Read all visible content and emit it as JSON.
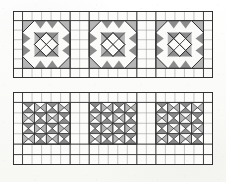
{
  "figure": {
    "background_color": "#fdfdfc",
    "grid_line_color": "#8d8d8d",
    "grid_line_color_major": "#3a3a3a",
    "outline_color": "#2b2b2b",
    "shade_dark": "#8f8f8f",
    "shade_light": "#bcbcbc",
    "shade_white": "#fbfbfa"
  },
  "panels": [
    {
      "id": "panel-top",
      "name": "top-panel",
      "columns": 21,
      "rows": 7,
      "cell_size": 9.52,
      "blocks": [
        {
          "id": "block-top-1",
          "name": "octagon-star-block-1",
          "type": "octagon-rosette",
          "grid_origin_col": 1,
          "grid_origin_row": 1,
          "size_cells": 5
        },
        {
          "id": "block-top-2",
          "name": "octagon-star-block-2",
          "type": "octagon-rosette",
          "grid_origin_col": 8,
          "grid_origin_row": 1,
          "size_cells": 5
        },
        {
          "id": "block-top-3",
          "name": "octagon-star-block-3",
          "type": "octagon-rosette",
          "grid_origin_col": 15,
          "grid_origin_row": 1,
          "size_cells": 5
        }
      ]
    },
    {
      "id": "panel-bottom",
      "name": "bottom-panel",
      "columns": 21,
      "rows": 7,
      "cell_size": 9.52,
      "blocks": [
        {
          "id": "block-bottom-1",
          "name": "hourglass-x-block-1",
          "type": "hourglass-x",
          "grid_origin_col": 1,
          "grid_origin_row": 1,
          "size_cells": 4
        },
        {
          "id": "block-bottom-2",
          "name": "hourglass-x-block-2",
          "type": "hourglass-x",
          "grid_origin_col": 8,
          "grid_origin_row": 1,
          "size_cells": 4
        },
        {
          "id": "block-bottom-3",
          "name": "hourglass-x-block-3",
          "type": "hourglass-x",
          "grid_origin_col": 15,
          "grid_origin_row": 1,
          "size_cells": 4
        }
      ]
    }
  ]
}
